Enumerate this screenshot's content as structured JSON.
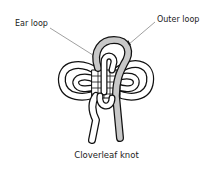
{
  "labels": {
    "ear_loop": "Ear loop",
    "outer_loop": "Outer loop"
  },
  "caption": "Cloverleaf knot",
  "colors": {
    "cord_fill": "#ffffff",
    "highlight_cord_fill": "#c8c8c8",
    "outline": "#111111",
    "leader_line": "#777777"
  }
}
